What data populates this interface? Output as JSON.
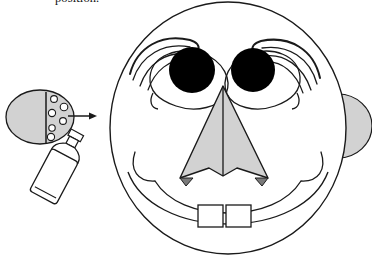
{
  "figure": {
    "caption_fragment": "position.",
    "background_color": "#ffffff",
    "stroke_color": "#1a1a1a",
    "fill_gray": "#d2d2d2",
    "fill_gray_dark": "#7a7a7a",
    "fill_black": "#000000",
    "fill_white": "#ffffff"
  },
  "parts": {
    "head": {
      "label": "head outline",
      "shape": "circle",
      "center_x": 228,
      "center_y": 128,
      "radius_x": 118,
      "radius_y": 126,
      "fill": "#ffffff",
      "stroke": "#1a1a1a"
    },
    "right_ear": {
      "label": "right ear",
      "shape": "half-ellipse",
      "fill": "#d2d2d2",
      "stroke": "#1a1a1a"
    },
    "left_eye": {
      "label": "left eye pupil",
      "center_x": 192,
      "center_y": 70,
      "radius": 23,
      "fill": "#000000"
    },
    "right_eye": {
      "label": "right eye pupil",
      "center_x": 253,
      "center_y": 70,
      "radius": 22,
      "fill": "#000000"
    },
    "left_eyebrow": {
      "label": "left eyebrow",
      "stroke_count": 4
    },
    "right_eyebrow": {
      "label": "right eyebrow",
      "stroke_count": 4
    },
    "nose": {
      "label": "nose",
      "shape": "arrow-like triangle with center ridge",
      "fill": "#d2d2d2",
      "stroke": "#1a1a1a",
      "nostril_fill": "#7a7a7a",
      "nostril_count": 2
    },
    "mouth": {
      "label": "mouth smile curve",
      "stroke": "#1a1a1a"
    },
    "teeth": {
      "label": "front teeth",
      "count": 2,
      "fill": "#ffffff",
      "stroke": "#1a1a1a"
    },
    "cheeks": {
      "label": "cheek crease lines",
      "count": 2
    },
    "spray_cloud": {
      "label": "spray mist cloud",
      "fill": "#d2d2d2",
      "stroke": "#1a1a1a",
      "droplet_count": 6,
      "droplet_fill": "#ffffff"
    },
    "spray_bottle": {
      "label": "spray bottle",
      "fill": "#ffffff",
      "stroke": "#1a1a1a",
      "rotation_deg": 28
    },
    "arrow": {
      "label": "direction arrow pointing to face",
      "from_x": 68,
      "from_y": 116,
      "to_x": 95,
      "to_y": 116,
      "stroke": "#1a1a1a"
    }
  }
}
